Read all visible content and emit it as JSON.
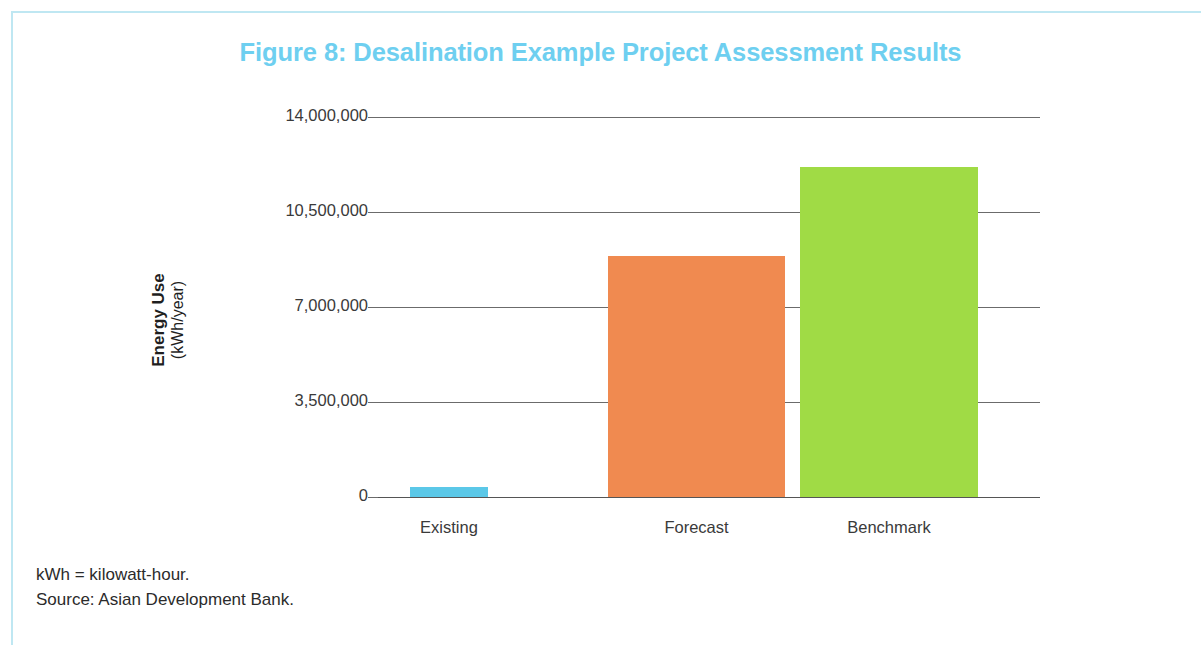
{
  "figure": {
    "title": "Figure 8: Desalination Example Project Assessment Results",
    "title_color": "#6ecff0",
    "frame_color": "#bfe7f2"
  },
  "notes": {
    "abbreviation": "kWh = kilowatt-hour.",
    "source": "Source: Asian Development Bank."
  },
  "chart_data": {
    "type": "bar",
    "title": "Figure 8: Desalination Example Project Assessment Results",
    "xlabel": "",
    "ylabel": "Energy Use (kWh/year)",
    "ylabel_main": "Energy Use",
    "ylabel_unit": "(kWh/year)",
    "categories": [
      "Existing",
      "Forecast",
      "Benchmark"
    ],
    "values": [
      370000,
      8880000,
      12160000
    ],
    "colors": [
      "#5bc8e8",
      "#f08a50",
      "#a0db45"
    ],
    "ylim": [
      0,
      14000000
    ],
    "ytick_values": [
      0,
      3500000,
      7000000,
      10500000,
      14000000
    ],
    "ytick_labels": [
      "0",
      "3,500,000",
      "7,000,000",
      "10,500,000",
      "14,000,000"
    ],
    "grid": true,
    "grid_axis": "y",
    "legend": null,
    "legend_position": "none",
    "bars": [
      {
        "category": "Existing",
        "value": 370000,
        "color": "#5bc8e8"
      },
      {
        "category": "Forecast",
        "value": 8880000,
        "color": "#f08a50"
      },
      {
        "category": "Benchmark",
        "value": 12160000,
        "color": "#a0db45"
      }
    ]
  }
}
